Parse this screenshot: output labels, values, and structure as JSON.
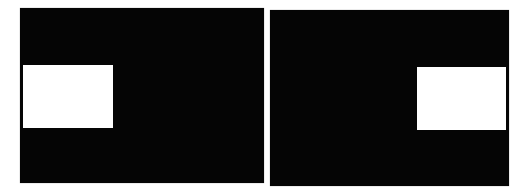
{
  "figure": {
    "colors": {
      "panel": "#050505",
      "rect": "#ffffff",
      "background": "#ffffff"
    },
    "panels": [
      {
        "id": "left",
        "box": {
          "x": 20,
          "y": 8,
          "w": 244,
          "h": 175
        },
        "rect": {
          "x": 23,
          "y": 65,
          "w": 90,
          "h": 63
        }
      },
      {
        "id": "right",
        "box": {
          "x": 270,
          "y": 10,
          "w": 239,
          "h": 176
        },
        "rect": {
          "x": 417,
          "y": 67,
          "w": 89,
          "h": 63
        }
      }
    ]
  }
}
